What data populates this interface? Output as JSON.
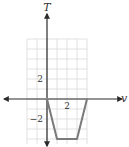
{
  "chart_data": {
    "type": "line",
    "title": "",
    "xlabel": "v",
    "ylabel": "T",
    "xlim": [
      -2,
      4
    ],
    "ylim": [
      -4.5,
      6
    ],
    "grid": true,
    "x_tick_labels": [
      {
        "value": 2,
        "text": "2"
      }
    ],
    "y_tick_labels": [
      {
        "value": 2,
        "text": "2"
      },
      {
        "value": -2,
        "text": "−2"
      }
    ],
    "series": [
      {
        "name": "T(v)",
        "color": "#7a7a7a",
        "points": [
          [
            0,
            0
          ],
          [
            1,
            -4
          ],
          [
            3,
            -4
          ],
          [
            4,
            0
          ]
        ]
      }
    ]
  }
}
